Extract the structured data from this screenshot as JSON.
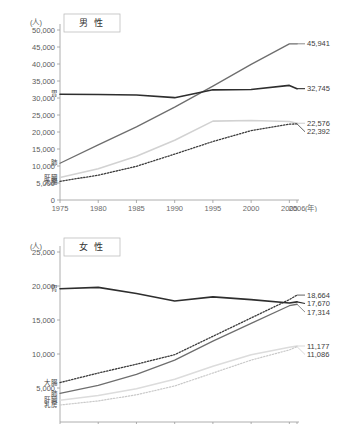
{
  "figure": {
    "unit_label": "(人)",
    "year_suffix": "(年)"
  },
  "chart_data": [
    {
      "id": "male",
      "type": "line",
      "title": "男 性",
      "xlabel": "(年)",
      "ylabel": "(人)",
      "x": [
        1975,
        1980,
        1985,
        1990,
        1995,
        2000,
        2005,
        2006
      ],
      "xtick_labels": [
        "1975",
        "1980",
        "1985",
        "1990",
        "1995",
        "2000",
        "2005",
        "2006"
      ],
      "ylim": [
        0,
        50000
      ],
      "ytick_labels": [
        "0",
        "5,000",
        "10,000",
        "15,000",
        "20,000",
        "25,000",
        "30,000",
        "35,000",
        "40,000",
        "45,000",
        "50,000"
      ],
      "yticks": [
        0,
        5000,
        10000,
        15000,
        20000,
        25000,
        30000,
        35000,
        40000,
        45000,
        50000
      ],
      "grid": false,
      "legend": "inline-left-and-right",
      "series": [
        {
          "name": "肺",
          "left_label": "肺",
          "end_label": "45,941",
          "color": "#6e6e6e",
          "width": 1.3,
          "dash": "none",
          "values": [
            10800,
            16200,
            21500,
            27300,
            33500,
            39900,
            45900,
            45941
          ]
        },
        {
          "name": "胃",
          "left_label": "胃",
          "end_label": "32,745",
          "color": "#2e2e2e",
          "width": 1.6,
          "dash": "none",
          "values": [
            31100,
            31050,
            30900,
            30100,
            32400,
            32500,
            33700,
            32745
          ]
        },
        {
          "name": "肝臓",
          "left_label": "肝臓",
          "end_label": "22,576",
          "color": "#d2d2d2",
          "width": 1.6,
          "dash": "none",
          "values": [
            6600,
            9200,
            12900,
            17600,
            23200,
            23400,
            23100,
            22576
          ]
        },
        {
          "name": "大腸",
          "left_label": "大腸",
          "end_label": "22,392",
          "color": "#3a3a3a",
          "width": 1.3,
          "dash": "1.4,1.6",
          "values": [
            5500,
            7300,
            9900,
            13500,
            17200,
            20400,
            22300,
            22392
          ]
        }
      ]
    },
    {
      "id": "female",
      "type": "line",
      "title": "女 性",
      "xlabel": "(年)",
      "ylabel": "(人)",
      "x": [
        1975,
        1980,
        1985,
        1990,
        1995,
        2000,
        2005,
        2006
      ],
      "xtick_labels": [
        "1975",
        "1980",
        "1985",
        "1990",
        "1995",
        "2000",
        "2005",
        "2006"
      ],
      "ylim": [
        0,
        25000
      ],
      "ytick_labels": [
        "5,000",
        "10,000",
        "15,000",
        "20,000",
        "25,000"
      ],
      "yticks": [
        5000,
        10000,
        15000,
        20000,
        25000
      ],
      "grid": false,
      "legend": "inline-left-and-right",
      "series": [
        {
          "name": "大腸",
          "left_label": "大腸",
          "end_label": "18,664",
          "color": "#3a3a3a",
          "width": 1.3,
          "dash": "1.4,1.6",
          "values": [
            5800,
            7200,
            8500,
            9900,
            12600,
            15300,
            18000,
            18664
          ]
        },
        {
          "name": "胃",
          "left_label": "胃",
          "end_label": "17,670",
          "color": "#2e2e2e",
          "width": 1.6,
          "dash": "none",
          "values": [
            19600,
            19800,
            18900,
            17800,
            18400,
            18000,
            17500,
            17670
          ]
        },
        {
          "name": "肺",
          "left_label": "肺",
          "end_label": "17,314",
          "color": "#6e6e6e",
          "width": 1.3,
          "dash": "none",
          "values": [
            4200,
            5400,
            7000,
            9100,
            11900,
            14500,
            17100,
            17314
          ]
        },
        {
          "name": "肝臓",
          "left_label": "肝臓",
          "end_label": "11,177",
          "color": "#dcdcdc",
          "width": 1.6,
          "dash": "none",
          "values": [
            3200,
            3900,
            4900,
            6300,
            8200,
            9900,
            11000,
            11177
          ]
        },
        {
          "name": "乳房",
          "left_label": "乳房",
          "end_label": "11,086",
          "color": "#c9c9c9",
          "width": 1.2,
          "dash": "1.4,1.6",
          "values": [
            2500,
            3100,
            4000,
            5300,
            7200,
            9100,
            10600,
            11086
          ]
        }
      ]
    }
  ]
}
